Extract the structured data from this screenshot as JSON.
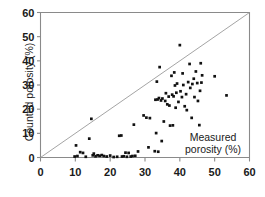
{
  "chart_data": {
    "type": "scatter",
    "title": "",
    "xlabel": "Measured porosity (%)",
    "ylabel": "Counted porosity (%)",
    "xlim": [
      0,
      60
    ],
    "ylim": [
      0,
      60
    ],
    "xticks": [
      0,
      10,
      20,
      30,
      40,
      50,
      60
    ],
    "yticks": [
      0,
      10,
      20,
      30,
      40,
      50,
      60
    ],
    "grid": false,
    "legend": null,
    "annotations": [
      {
        "text": "Measured porosity (%)",
        "x": 44,
        "y": 9,
        "role": "x-axis-title-inside-plot"
      }
    ],
    "reference_line": {
      "name": "1:1 identity line",
      "from": [
        0,
        0
      ],
      "to": [
        60,
        60
      ],
      "style": "thin-solid-gray"
    },
    "series": [
      {
        "name": "samples",
        "marker": "filled-square",
        "color": "#111111",
        "points": [
          [
            9.8,
            0.4
          ],
          [
            10.2,
            5.0
          ],
          [
            10.6,
            0.6
          ],
          [
            11.4,
            2.2
          ],
          [
            12.2,
            1.9
          ],
          [
            13.0,
            0.3
          ],
          [
            14.0,
            7.8
          ],
          [
            14.6,
            16.0
          ],
          [
            15.0,
            0.9
          ],
          [
            15.3,
            1.6
          ],
          [
            15.8,
            0.5
          ],
          [
            16.4,
            0.9
          ],
          [
            17.0,
            0.7
          ],
          [
            17.6,
            1.0
          ],
          [
            18.2,
            0.6
          ],
          [
            19.0,
            0.4
          ],
          [
            20.0,
            0.8
          ],
          [
            21.0,
            0.2
          ],
          [
            22.0,
            0.3
          ],
          [
            22.6,
            9.0
          ],
          [
            23.2,
            9.1
          ],
          [
            23.4,
            0.4
          ],
          [
            23.9,
            0.5
          ],
          [
            24.4,
            2.0
          ],
          [
            24.8,
            0.3
          ],
          [
            25.3,
            1.9
          ],
          [
            25.9,
            0.4
          ],
          [
            26.4,
            0.6
          ],
          [
            26.8,
            13.6
          ],
          [
            27.2,
            0.7
          ],
          [
            28.0,
            2.5
          ],
          [
            29.6,
            17.4
          ],
          [
            30.4,
            16.5
          ],
          [
            31.0,
            4.2
          ],
          [
            31.4,
            16.3
          ],
          [
            32.8,
            2.6
          ],
          [
            33.0,
            23.9
          ],
          [
            33.2,
            10.1
          ],
          [
            33.4,
            31.4
          ],
          [
            33.6,
            24.0
          ],
          [
            33.8,
            2.4
          ],
          [
            34.0,
            24.6
          ],
          [
            34.2,
            37.4
          ],
          [
            34.6,
            23.6
          ],
          [
            34.8,
            6.8
          ],
          [
            35.0,
            24.4
          ],
          [
            35.4,
            14.9
          ],
          [
            35.8,
            23.4
          ],
          [
            36.0,
            26.6
          ],
          [
            36.4,
            22.0
          ],
          [
            36.8,
            25.2
          ],
          [
            37.0,
            21.5
          ],
          [
            37.2,
            13.2
          ],
          [
            37.6,
            33.8
          ],
          [
            37.8,
            26.0
          ],
          [
            38.0,
            13.3
          ],
          [
            38.2,
            25.3
          ],
          [
            38.4,
            35.2
          ],
          [
            38.6,
            29.8
          ],
          [
            38.8,
            20.6
          ],
          [
            39.0,
            26.8
          ],
          [
            39.2,
            30.6
          ],
          [
            39.6,
            23.0
          ],
          [
            40.0,
            46.5
          ],
          [
            40.2,
            27.4
          ],
          [
            40.6,
            25.0
          ],
          [
            40.8,
            34.8
          ],
          [
            41.0,
            30.0
          ],
          [
            41.4,
            21.2
          ],
          [
            41.8,
            26.2
          ],
          [
            42.0,
            19.6
          ],
          [
            42.4,
            31.2
          ],
          [
            42.8,
            38.7
          ],
          [
            43.0,
            28.8
          ],
          [
            43.4,
            16.4
          ],
          [
            43.6,
            30.4
          ],
          [
            44.0,
            32.6
          ],
          [
            44.2,
            25.0
          ],
          [
            44.6,
            35.6
          ],
          [
            45.0,
            30.8
          ],
          [
            45.2,
            23.4
          ],
          [
            45.6,
            13.4
          ],
          [
            45.8,
            27.6
          ],
          [
            46.0,
            39.0
          ],
          [
            46.2,
            31.0
          ],
          [
            46.4,
            34.0
          ],
          [
            50.0,
            33.6
          ],
          [
            53.4,
            25.7
          ]
        ]
      }
    ]
  },
  "axes": {
    "x_tick_labels": [
      "0",
      "10",
      "20",
      "30",
      "40",
      "50",
      "60"
    ],
    "y_tick_labels": [
      "0",
      "10",
      "20",
      "30",
      "40",
      "50",
      "60"
    ],
    "y_axis_title": "Counted porosity (%)",
    "x_axis_title_line1": "Measured",
    "x_axis_title_line2": "porosity (%)"
  },
  "colors": {
    "marker": "#111111",
    "axis": "#8a8a8a",
    "identity_line": "#9a9a9a",
    "text": "#1a1a1a",
    "background": "#ffffff"
  }
}
